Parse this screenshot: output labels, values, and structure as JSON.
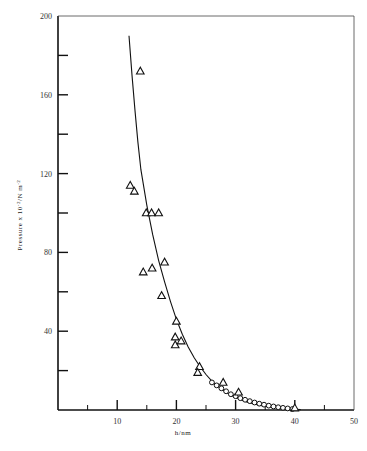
{
  "chart_data": {
    "type": "scatter",
    "title": "",
    "xlabel": "h/nm",
    "ylabel": "Pressure x 10^-2/N m^-2",
    "ylabel_parts": {
      "main": "Pressure  x  10",
      "exp1": "-2",
      "mid": "/N m",
      "exp2": "-2"
    },
    "xlim": [
      0,
      50
    ],
    "ylim": [
      0,
      200
    ],
    "x_ticks_major": [
      10,
      20,
      30,
      40,
      50
    ],
    "x_tick_labels": [
      "10",
      "20",
      "30",
      "40",
      "50"
    ],
    "x_ticks_minor": [
      5,
      15,
      25,
      35,
      45
    ],
    "y_ticks_major": [
      40,
      80,
      120,
      160,
      200
    ],
    "y_tick_labels": [
      "40",
      "80",
      "120",
      "160",
      "200"
    ],
    "y_ticks_minor": [
      20,
      60,
      100,
      140,
      180
    ],
    "grid": false,
    "legend": null,
    "series": [
      {
        "name": "triangles",
        "marker": "triangle-open",
        "points": [
          [
            13.9,
            172
          ],
          [
            12.2,
            114
          ],
          [
            12.9,
            111
          ],
          [
            14.9,
            100
          ],
          [
            15.8,
            100
          ],
          [
            17.0,
            100
          ],
          [
            14.4,
            70
          ],
          [
            15.9,
            72
          ],
          [
            18.0,
            75
          ],
          [
            17.5,
            58
          ],
          [
            20.0,
            45
          ],
          [
            19.8,
            37
          ],
          [
            19.8,
            33
          ],
          [
            20.8,
            35
          ],
          [
            23.9,
            22
          ],
          [
            23.6,
            19
          ],
          [
            27.9,
            14
          ],
          [
            30.5,
            9
          ],
          [
            40.0,
            1
          ]
        ]
      },
      {
        "name": "circles",
        "marker": "circle-open",
        "points": [
          [
            26.0,
            14
          ],
          [
            26.8,
            12.5
          ],
          [
            27.6,
            11
          ],
          [
            28.4,
            9.5
          ],
          [
            29.2,
            8
          ],
          [
            30.0,
            7
          ],
          [
            30.8,
            6
          ],
          [
            31.6,
            5.2
          ],
          [
            32.4,
            4.5
          ],
          [
            33.2,
            3.8
          ],
          [
            34.0,
            3.2
          ],
          [
            34.8,
            2.7
          ],
          [
            35.6,
            2.2
          ],
          [
            36.4,
            1.8
          ],
          [
            37.2,
            1.4
          ],
          [
            38.0,
            1.1
          ],
          [
            38.8,
            0.8
          ],
          [
            39.6,
            0.5
          ]
        ]
      },
      {
        "name": "fit-curve",
        "marker": "line",
        "points": [
          [
            12.0,
            190
          ],
          [
            12.5,
            170
          ],
          [
            13.0,
            152
          ],
          [
            13.5,
            136
          ],
          [
            14.0,
            122
          ],
          [
            15.0,
            104
          ],
          [
            16.0,
            89
          ],
          [
            17.0,
            76
          ],
          [
            18.0,
            65
          ],
          [
            19.0,
            55
          ],
          [
            20.0,
            46
          ],
          [
            21.0,
            38.5
          ],
          [
            22.0,
            32
          ],
          [
            23.0,
            26.5
          ],
          [
            24.0,
            22
          ],
          [
            25.0,
            18
          ],
          [
            26.0,
            14.7
          ],
          [
            27.0,
            12
          ],
          [
            28.0,
            9.7
          ],
          [
            29.0,
            7.8
          ],
          [
            30.0,
            6.3
          ],
          [
            31.0,
            5.0
          ],
          [
            32.0,
            4.0
          ],
          [
            33.0,
            3.2
          ],
          [
            34.0,
            2.5
          ],
          [
            35.0,
            2.0
          ],
          [
            36.0,
            1.5
          ],
          [
            37.0,
            1.2
          ],
          [
            38.0,
            0.9
          ],
          [
            39.0,
            0.6
          ],
          [
            40.0,
            0.4
          ],
          [
            41.0,
            0.2
          ]
        ]
      }
    ]
  }
}
